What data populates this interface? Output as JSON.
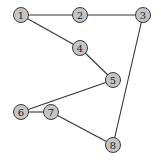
{
  "diagram": {
    "type": "undirected-graph",
    "style": {
      "node_fill": "#c4c4c4",
      "node_stroke": "#3a3a3a",
      "edge_color": "#333333",
      "background": "#ffffff",
      "node_radius": 7.5
    },
    "nodes": [
      {
        "id": "1",
        "label": "1",
        "x": 21,
        "y": 15
      },
      {
        "id": "2",
        "label": "2",
        "x": 80,
        "y": 15
      },
      {
        "id": "3",
        "label": "3",
        "x": 143,
        "y": 15
      },
      {
        "id": "4",
        "label": "4",
        "x": 80,
        "y": 48
      },
      {
        "id": "5",
        "label": "5",
        "x": 113,
        "y": 80
      },
      {
        "id": "6",
        "label": "6",
        "x": 21,
        "y": 112
      },
      {
        "id": "7",
        "label": "7",
        "x": 51,
        "y": 112
      },
      {
        "id": "8",
        "label": "8",
        "x": 113,
        "y": 145
      }
    ],
    "edges": [
      {
        "from": "1",
        "to": "2"
      },
      {
        "from": "2",
        "to": "3"
      },
      {
        "from": "1",
        "to": "4"
      },
      {
        "from": "4",
        "to": "5"
      },
      {
        "from": "5",
        "to": "6"
      },
      {
        "from": "6",
        "to": "7"
      },
      {
        "from": "7",
        "to": "8"
      },
      {
        "from": "3",
        "to": "8"
      }
    ]
  }
}
